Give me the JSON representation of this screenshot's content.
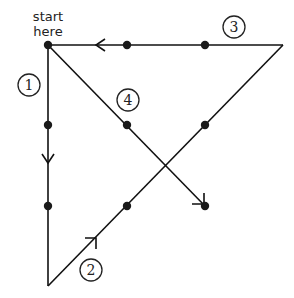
{
  "diagram": {
    "start_label_line1": "start",
    "start_label_line2": "here",
    "step_labels": [
      "1",
      "2",
      "3",
      "4"
    ],
    "colors": {
      "line": "#111111",
      "dot": "#1a1a1a",
      "background": "#ffffff"
    },
    "dots_grid": "3x3",
    "path": [
      {
        "step": "1",
        "from": "start (top-left dot)",
        "to": "below bottom-left dot",
        "direction": "down"
      },
      {
        "step": "2",
        "from": "bottom-left extension",
        "to": "beyond top-right dot",
        "direction": "up-right"
      },
      {
        "step": "3",
        "from": "top-right extension",
        "to": "top-left dot",
        "direction": "left"
      },
      {
        "step": "4",
        "from": "top-left dot",
        "to": "bottom-right dot",
        "direction": "down-right"
      }
    ]
  }
}
